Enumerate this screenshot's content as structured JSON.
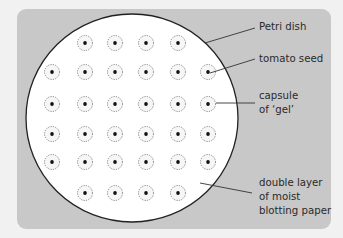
{
  "diagram": {
    "labels": {
      "petri_dish": "Petri dish",
      "tomato_seed": "tomato seed",
      "capsule_line1": "capsule",
      "capsule_line2": "of ‘gel’",
      "paper_line1": "double layer",
      "paper_line2": "of moist",
      "paper_line3": "blotting paper"
    },
    "seed_grid": {
      "rows": [
        {
          "y": 43,
          "x": [
            85,
            115,
            146,
            178
          ]
        },
        {
          "y": 72,
          "x": [
            52,
            85,
            115,
            146,
            178,
            208
          ]
        },
        {
          "y": 104,
          "x": [
            52,
            85,
            115,
            146,
            178,
            208
          ]
        },
        {
          "y": 134,
          "x": [
            52,
            85,
            115,
            146,
            178,
            208
          ]
        },
        {
          "y": 162,
          "x": [
            52,
            85,
            115,
            146,
            178,
            208
          ]
        },
        {
          "y": 193,
          "x": [
            85,
            115,
            146,
            178
          ]
        }
      ],
      "count": 32
    },
    "colors": {
      "page_bg": "#f1f1f1",
      "panel": "#c8c8c8",
      "dish_fill": "#ffffff",
      "outline": "#222222",
      "text": "#2a2a2a"
    }
  }
}
